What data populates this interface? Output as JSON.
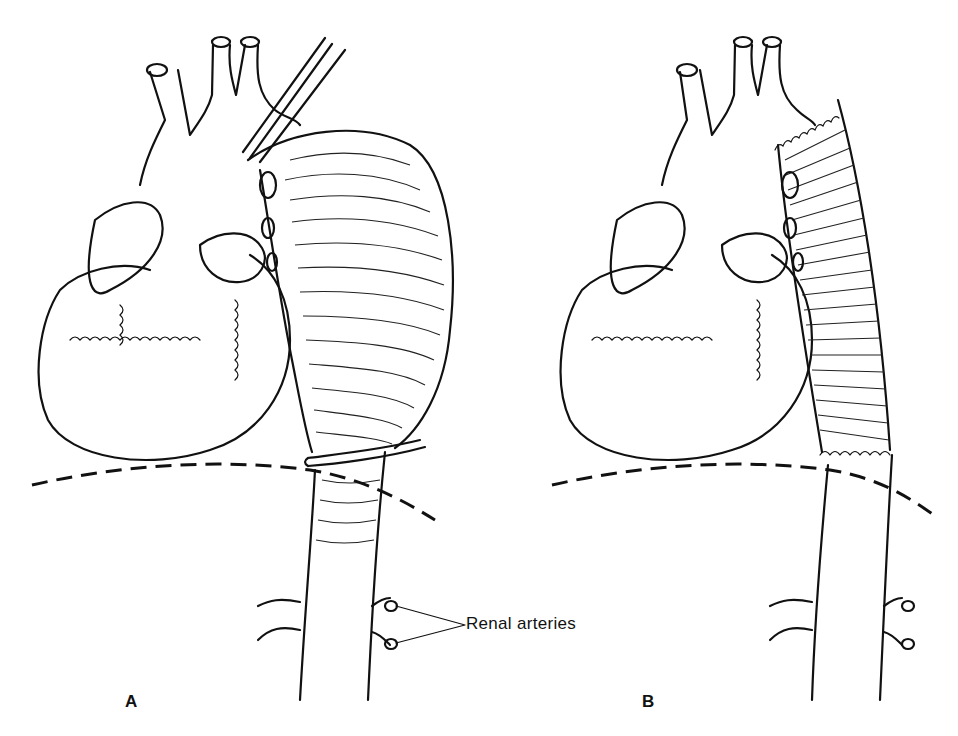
{
  "figure": {
    "panels": [
      {
        "id": "A",
        "label": "A",
        "description": "Heart with aortic arch and large thoracic aortic aneurysm, clamped above and below"
      },
      {
        "id": "B",
        "label": "B",
        "description": "Heart with aortic arch after replacement of aneurysmal segment by corrugated tubular graft"
      }
    ],
    "annotations": {
      "renal_arteries": "Renal arteries"
    }
  }
}
